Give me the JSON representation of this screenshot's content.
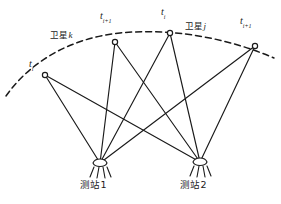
{
  "figure": {
    "type": "satellite-station-observation-geometry-diagram",
    "background_color": "#ffffff",
    "stroke_color": "#1a1a1a",
    "width": 281,
    "height": 204
  },
  "orbit": {
    "name": "satellite-orbit-arc",
    "style": "dashed",
    "label_left": {
      "cjk": "卫星",
      "italic": "k",
      "x": 50,
      "y": 31
    },
    "label_right": {
      "cjk": "卫星",
      "italic": "j",
      "x": 185,
      "y": 22
    }
  },
  "satellite_nodes": [
    {
      "id": "node-ti-left",
      "label_cjk": "t",
      "sub": "i",
      "x": 45,
      "y": 75,
      "label_x": 29,
      "label_y": 59
    },
    {
      "id": "node-ti1-mid1",
      "label_cjk": "t",
      "sub": "i+1",
      "x": 115,
      "y": 42,
      "label_x": 100,
      "label_y": 11
    },
    {
      "id": "node-ti-mid2",
      "label_cjk": "t",
      "sub": "i",
      "x": 170,
      "y": 33,
      "label_x": 161,
      "label_y": 7
    },
    {
      "id": "node-ti1-right",
      "label_cjk": "t",
      "sub": "i+1",
      "x": 255,
      "y": 46,
      "label_x": 240,
      "label_y": 16
    }
  ],
  "stations": [
    {
      "id": "station-1",
      "label": "测站1",
      "x": 100,
      "y": 163,
      "label_x": 80,
      "label_y": 180
    },
    {
      "id": "station-2",
      "label": "测站2",
      "x": 200,
      "y": 162,
      "label_x": 180,
      "label_y": 180
    }
  ],
  "sight_lines": {
    "name": "observation-sight-lines",
    "count": 8,
    "description": "each satellite node connects to both ground stations"
  }
}
